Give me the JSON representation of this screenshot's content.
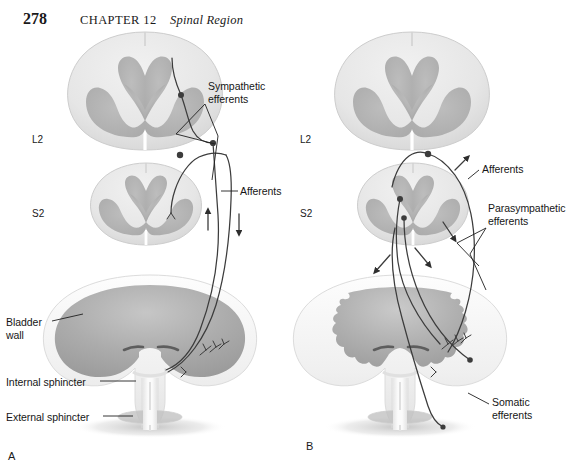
{
  "page": {
    "folio": "278",
    "chapter_label": "CHAPTER 12",
    "chapter_title": "Spinal Region"
  },
  "figure": {
    "panels": [
      {
        "letter": "A",
        "name": "sympathetic-afferent-panel",
        "cord_levels": [
          "L2",
          "S2"
        ],
        "callouts": [
          {
            "name": "sympathetic-efferents",
            "text": "Sympathetic\nefferents"
          },
          {
            "name": "afferents",
            "text": "Afferents"
          },
          {
            "name": "bladder-wall",
            "text": "Bladder\nwall"
          },
          {
            "name": "internal-sphincter",
            "text": "Internal sphincter"
          },
          {
            "name": "external-sphincter",
            "text": "External sphincter"
          }
        ]
      },
      {
        "letter": "B",
        "name": "parasympathetic-somatic-panel",
        "cord_levels": [
          "L2",
          "S2"
        ],
        "callouts": [
          {
            "name": "afferents",
            "text": "Afferents"
          },
          {
            "name": "parasympathetic-efferents",
            "text": "Parasympathetic\nefferents"
          },
          {
            "name": "somatic-efferents",
            "text": "Somatic\nefferents"
          }
        ]
      }
    ],
    "colors": {
      "white_matter": "#e9e9e9",
      "white_matter_edge": "#cfcfcf",
      "gray_matter": "#b4b4b4",
      "bladder_lumen": "#a9a9a9",
      "bladder_wall": "#f2f2f2",
      "nerve_line": "#3c3c3c",
      "text": "#161616"
    }
  }
}
